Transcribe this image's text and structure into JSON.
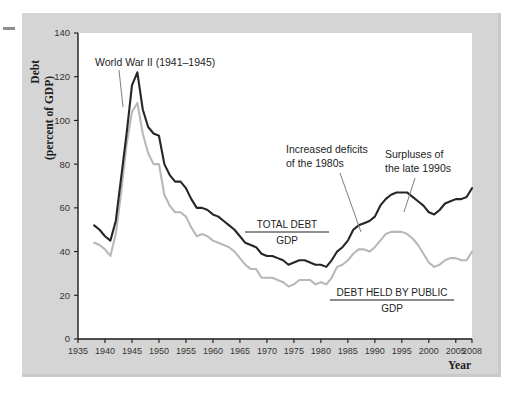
{
  "figure": {
    "background_color": "#ffffff",
    "panel_color": "#d5d5d5",
    "plot_background": "#ffffff"
  },
  "axis": {
    "y_title_line1": "Debt",
    "y_title_line2": "(percent of GDP)",
    "x_title": "Year"
  },
  "annotations": {
    "wwii": "World War II (1941–1945)",
    "deficits_line1": "Increased deficits",
    "deficits_line2": "of the 1980s",
    "surpluses_line1": "Surpluses of",
    "surpluses_line2": "the late 1990s"
  },
  "series_labels": {
    "total_debt_numerator": "TOTAL DEBT",
    "total_debt_denominator": "GDP",
    "public_debt_numerator": "DEBT HELD BY PUBLIC",
    "public_debt_denominator": "GDP"
  },
  "chart_data": {
    "type": "line",
    "title": "",
    "xlabel": "Year",
    "ylabel": "Debt (percent of GDP)",
    "xlim": [
      1935,
      2008
    ],
    "ylim": [
      0,
      140
    ],
    "grid": false,
    "legend": "inline-labels",
    "ytick_labels": [
      "0",
      "20",
      "40",
      "60",
      "80",
      "100",
      "120",
      "140"
    ],
    "ytick_values": [
      0,
      20,
      40,
      60,
      80,
      100,
      120,
      140
    ],
    "xtick_labels": [
      "1935",
      "1940",
      "1945",
      "1950",
      "1955",
      "1960",
      "1965",
      "1970",
      "1975",
      "1980",
      "1985",
      "1990",
      "1995",
      "2000",
      "2005",
      "2008"
    ],
    "xtick_values": [
      1935,
      1940,
      1945,
      1950,
      1955,
      1960,
      1965,
      1970,
      1975,
      1980,
      1985,
      1990,
      1995,
      2000,
      2005,
      2008
    ],
    "series": [
      {
        "name": "TOTAL DEBT / GDP",
        "color": "#262626",
        "x": [
          1938,
          1939,
          1940,
          1941,
          1942,
          1943,
          1944,
          1945,
          1946,
          1947,
          1948,
          1949,
          1950,
          1951,
          1952,
          1953,
          1954,
          1955,
          1956,
          1957,
          1958,
          1959,
          1960,
          1961,
          1962,
          1963,
          1964,
          1965,
          1966,
          1967,
          1968,
          1969,
          1970,
          1971,
          1972,
          1973,
          1974,
          1975,
          1976,
          1977,
          1978,
          1979,
          1980,
          1981,
          1982,
          1983,
          1984,
          1985,
          1986,
          1987,
          1988,
          1989,
          1990,
          1991,
          1992,
          1993,
          1994,
          1995,
          1996,
          1997,
          1998,
          1999,
          2000,
          2001,
          2002,
          2003,
          2004,
          2005,
          2006,
          2007,
          2008
        ],
        "values": [
          52,
          50,
          47,
          45,
          54,
          74,
          94,
          116,
          122,
          105,
          97,
          94,
          93,
          80,
          75,
          72,
          72,
          69,
          64,
          60,
          60,
          59,
          57,
          56,
          54,
          52,
          50,
          47,
          44,
          43,
          42,
          39,
          38,
          38,
          37,
          36,
          34,
          35,
          36,
          36,
          35,
          34,
          34,
          33,
          36,
          40,
          42,
          45,
          50,
          52,
          53,
          54,
          56,
          61,
          64,
          66,
          67,
          67,
          67,
          65,
          63,
          61,
          58,
          57,
          59,
          62,
          63,
          64,
          64,
          65,
          69
        ]
      },
      {
        "name": "DEBT HELD BY PUBLIC / GDP",
        "color": "#b8b8b8",
        "x": [
          1938,
          1939,
          1940,
          1941,
          1942,
          1943,
          1944,
          1945,
          1946,
          1947,
          1948,
          1949,
          1950,
          1951,
          1952,
          1953,
          1954,
          1955,
          1956,
          1957,
          1958,
          1959,
          1960,
          1961,
          1962,
          1963,
          1964,
          1965,
          1966,
          1967,
          1968,
          1969,
          1970,
          1971,
          1972,
          1973,
          1974,
          1975,
          1976,
          1977,
          1978,
          1979,
          1980,
          1981,
          1982,
          1983,
          1984,
          1985,
          1986,
          1987,
          1988,
          1989,
          1990,
          1991,
          1992,
          1993,
          1994,
          1995,
          1996,
          1997,
          1998,
          1999,
          2000,
          2001,
          2002,
          2003,
          2004,
          2005,
          2006,
          2007,
          2008
        ],
        "values": [
          44,
          43,
          41,
          38,
          48,
          67,
          89,
          104,
          108,
          94,
          85,
          80,
          80,
          66,
          61,
          58,
          58,
          56,
          51,
          47,
          48,
          47,
          45,
          44,
          43,
          42,
          40,
          37,
          34,
          32,
          32,
          28,
          28,
          28,
          27,
          26,
          24,
          25,
          27,
          27,
          27,
          25,
          26,
          25,
          28,
          33,
          34,
          36,
          39,
          41,
          41,
          40,
          42,
          45,
          48,
          49,
          49,
          49,
          48,
          46,
          43,
          39,
          35,
          33,
          34,
          36,
          37,
          37,
          36,
          36,
          40
        ]
      }
    ]
  }
}
